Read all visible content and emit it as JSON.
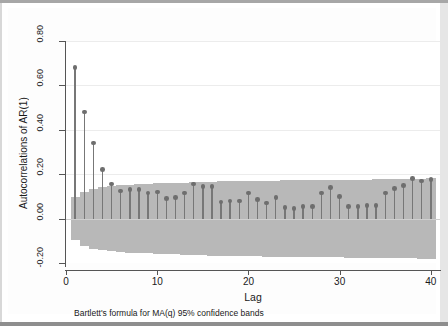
{
  "figure": {
    "background_color": "#ffffff",
    "plot_background_color": "#ffffff",
    "band_color": "#b8b8b8",
    "stem_color": "#777777",
    "marker_color": "#6e6e6e",
    "axis_color": "#555555",
    "gridline_color": "#ececec"
  },
  "chart_data": {
    "type": "line",
    "plot_kind": "autocorrelation-stem-plot",
    "title": "",
    "subtitle": "",
    "xlabel": "Lag",
    "ylabel": "Autocorrelations of AR(1)",
    "note": "Bartlett's formula for MA(q) 95% confidence bands",
    "xlim": [
      0,
      41
    ],
    "ylim": [
      -0.2,
      0.8
    ],
    "xticks": [
      0,
      10,
      20,
      30,
      40
    ],
    "xtick_labels": [
      "0",
      "10",
      "20",
      "30",
      "40"
    ],
    "yticks": [
      -0.2,
      0.0,
      0.2,
      0.4,
      0.6,
      0.8
    ],
    "ytick_labels": [
      "-0.20",
      "0.00",
      "0.20",
      "0.40",
      "0.60",
      "0.80"
    ],
    "grid": true,
    "legend": "none",
    "x": [
      1,
      2,
      3,
      4,
      5,
      6,
      7,
      8,
      9,
      10,
      11,
      12,
      13,
      14,
      15,
      16,
      17,
      18,
      19,
      20,
      21,
      22,
      23,
      24,
      25,
      26,
      27,
      28,
      29,
      30,
      31,
      32,
      33,
      34,
      35,
      36,
      37,
      38,
      39,
      40
    ],
    "values": [
      0.68,
      0.48,
      0.34,
      0.22,
      0.155,
      0.125,
      0.13,
      0.13,
      0.115,
      0.12,
      0.09,
      0.095,
      0.115,
      0.155,
      0.145,
      0.145,
      0.075,
      0.08,
      0.08,
      0.115,
      0.085,
      0.07,
      0.095,
      0.05,
      0.045,
      0.055,
      0.055,
      0.115,
      0.14,
      0.1,
      0.055,
      0.055,
      0.06,
      0.06,
      0.115,
      0.135,
      0.15,
      0.18,
      0.17,
      0.175
    ],
    "confidence_band": {
      "label": "Bartlett 95% confidence band",
      "upper": [
        0.098,
        0.122,
        0.135,
        0.143,
        0.147,
        0.15,
        0.153,
        0.155,
        0.157,
        0.159,
        0.16,
        0.161,
        0.162,
        0.163,
        0.165,
        0.167,
        0.168,
        0.169,
        0.169,
        0.169,
        0.17,
        0.171,
        0.171,
        0.172,
        0.172,
        0.172,
        0.173,
        0.173,
        0.174,
        0.175,
        0.176,
        0.176,
        0.176,
        0.177,
        0.177,
        0.177,
        0.178,
        0.179,
        0.18,
        0.181
      ],
      "lower": [
        -0.098,
        -0.122,
        -0.135,
        -0.143,
        -0.147,
        -0.15,
        -0.153,
        -0.155,
        -0.157,
        -0.159,
        -0.16,
        -0.161,
        -0.162,
        -0.163,
        -0.165,
        -0.167,
        -0.168,
        -0.169,
        -0.169,
        -0.169,
        -0.17,
        -0.171,
        -0.171,
        -0.172,
        -0.172,
        -0.172,
        -0.173,
        -0.173,
        -0.174,
        -0.175,
        -0.176,
        -0.176,
        -0.176,
        -0.177,
        -0.177,
        -0.177,
        -0.178,
        -0.179,
        -0.18,
        -0.181
      ]
    }
  }
}
